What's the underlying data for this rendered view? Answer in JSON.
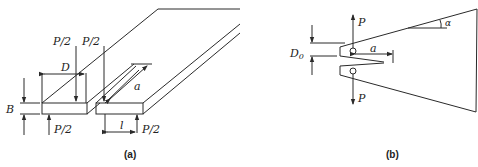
{
  "figure_a": {
    "caption": "(a)",
    "labels": {
      "load_top_left": "P/2",
      "load_top_right": "P/2",
      "load_bottom_left": "P/2",
      "load_bottom_right": "P/2",
      "width": "D",
      "thickness": "B",
      "crack_length": "a",
      "span": "l"
    }
  },
  "figure_b": {
    "caption": "(b)",
    "labels": {
      "load_top": "P",
      "load_bottom": "P",
      "opening": "D",
      "opening_subscript": "0",
      "crack_length": "a",
      "wedge_angle": "α"
    }
  }
}
